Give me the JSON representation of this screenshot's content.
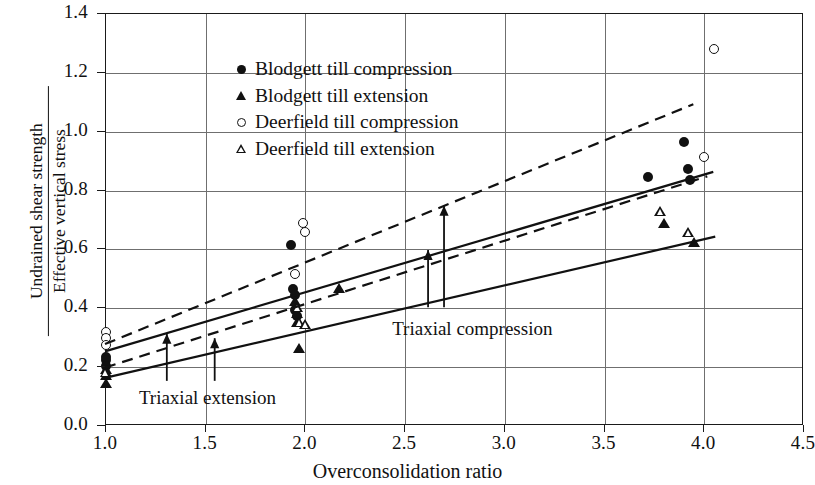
{
  "chart_data": {
    "type": "scatter",
    "title": "",
    "xlabel": "Overconsolidation ratio",
    "ylabel_numerator": "Undrained shear strength",
    "ylabel_denominator": "Effective vertical stress",
    "xlim": [
      1.0,
      4.5
    ],
    "ylim": [
      0.0,
      1.4
    ],
    "xticks": [
      "1.0",
      "1.5",
      "2.0",
      "2.5",
      "3.0",
      "3.5",
      "4.0",
      "4.5"
    ],
    "xtick_values": [
      1.0,
      1.5,
      2.0,
      2.5,
      3.0,
      3.5,
      4.0,
      4.5
    ],
    "yticks": [
      "0.0",
      "0.2",
      "0.4",
      "0.6",
      "0.8",
      "1.0",
      "1.2",
      "1.4"
    ],
    "ytick_values": [
      0.0,
      0.2,
      0.4,
      0.6,
      0.8,
      1.0,
      1.2,
      1.4
    ],
    "grid": true,
    "legend_position": "upper-left",
    "series": [
      {
        "name": "Blodgett till compression",
        "marker": "filled-circle",
        "points": [
          [
            1.0,
            0.235
          ],
          [
            1.0,
            0.225
          ],
          [
            1.0,
            0.205
          ],
          [
            1.93,
            0.615
          ],
          [
            1.94,
            0.465
          ],
          [
            1.95,
            0.445
          ],
          [
            1.95,
            0.395
          ],
          [
            1.96,
            0.375
          ],
          [
            3.72,
            0.845
          ],
          [
            3.9,
            0.965
          ],
          [
            3.92,
            0.875
          ],
          [
            3.93,
            0.835
          ]
        ]
      },
      {
        "name": "Blodgett till extension",
        "marker": "filled-triangle",
        "points": [
          [
            1.0,
            0.195
          ],
          [
            1.0,
            0.175
          ],
          [
            1.0,
            0.145
          ],
          [
            1.95,
            0.425
          ],
          [
            1.96,
            0.385
          ],
          [
            1.96,
            0.355
          ],
          [
            1.97,
            0.265
          ],
          [
            2.17,
            0.47
          ],
          [
            3.8,
            0.69
          ],
          [
            3.95,
            0.625
          ]
        ]
      },
      {
        "name": "Deerfield till compression",
        "marker": "open-circle",
        "points": [
          [
            1.0,
            0.32
          ],
          [
            1.0,
            0.3
          ],
          [
            1.0,
            0.275
          ],
          [
            1.99,
            0.69
          ],
          [
            2.0,
            0.66
          ],
          [
            1.95,
            0.515
          ],
          [
            4.0,
            0.915
          ],
          [
            4.05,
            1.28
          ]
        ]
      },
      {
        "name": "Deerfield till extension",
        "marker": "open-triangle",
        "points": [
          [
            1.0,
            0.185
          ],
          [
            1.96,
            0.44
          ],
          [
            1.97,
            0.42
          ],
          [
            2.0,
            0.45
          ],
          [
            3.78,
            0.865
          ],
          [
            3.92,
            0.83
          ]
        ]
      }
    ],
    "trend_lines": [
      {
        "name": "deerfield-compression-trend",
        "style": "dashed",
        "x": [
          1.0,
          3.95
        ],
        "y": [
          0.275,
          1.09
        ]
      },
      {
        "name": "blodgett-compression-trend",
        "style": "solid",
        "x": [
          1.0,
          4.05
        ],
        "y": [
          0.25,
          0.86
        ]
      },
      {
        "name": "deerfield-extension-trend",
        "style": "dashed",
        "x": [
          1.0,
          4.02
        ],
        "y": [
          0.195,
          0.845
        ]
      },
      {
        "name": "blodgett-extension-trend",
        "style": "solid",
        "x": [
          1.0,
          4.06
        ],
        "y": [
          0.16,
          0.64
        ]
      }
    ],
    "annotations": [
      {
        "text": "Triaxial extension",
        "text_x": 1.17,
        "text_y": 0.085,
        "arrows": [
          {
            "x": 1.31,
            "y0": 0.15,
            "y1": 0.31
          },
          {
            "x": 1.55,
            "y0": 0.15,
            "y1": 0.295
          }
        ]
      },
      {
        "text": "Triaxial compression",
        "text_x": 2.44,
        "text_y": 0.32,
        "arrows": [
          {
            "x": 2.62,
            "y0": 0.4,
            "y1": 0.595
          },
          {
            "x": 2.7,
            "y0": 0.4,
            "y1": 0.745
          }
        ]
      }
    ]
  },
  "legend": {
    "entries": [
      {
        "label": "Blodgett till compression",
        "marker": "filled-circle"
      },
      {
        "label": "Blodgett till extension",
        "marker": "filled-triangle"
      },
      {
        "label": "Deerfield till compression",
        "marker": "open-circle"
      },
      {
        "label": "Deerfield till extension",
        "marker": "open-triangle"
      }
    ]
  }
}
